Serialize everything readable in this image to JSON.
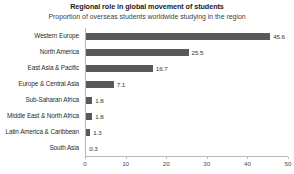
{
  "chart_data": {
    "type": "bar",
    "orientation": "horizontal",
    "title": "Regional role in global movement of students",
    "subtitle": "Proportion of overseas students worldwide studying in the region",
    "xlabel": "",
    "ylabel": "",
    "xlim": [
      0,
      50
    ],
    "xticks": [
      0,
      10,
      20,
      30,
      40,
      50
    ],
    "xtick_labels": [
      "0",
      "10",
      "20",
      "30",
      "40",
      "50"
    ],
    "grid": false,
    "legend": false,
    "bar_color": "#595959",
    "categories": [
      "Western Europe",
      "North America",
      "East Asia & Pacific",
      "Europe & Central Asia",
      "Sub-Saharan Africa",
      "Middle East & North Africa",
      "Latin America & Caribbean",
      "South Asia"
    ],
    "values": [
      45.6,
      25.5,
      16.7,
      7.1,
      1.8,
      1.8,
      1.3,
      0.3
    ],
    "value_labels": [
      "45.6",
      "25.5",
      "16.7",
      "7.1",
      "1.8",
      "1.8",
      "1.3",
      "0.3"
    ]
  }
}
